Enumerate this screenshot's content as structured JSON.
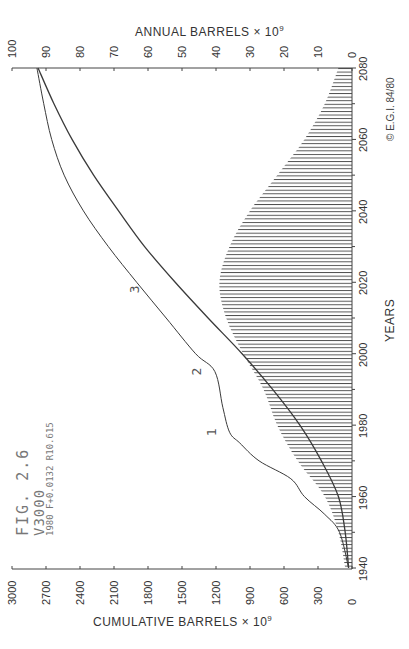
{
  "chart_data": {
    "type": "area",
    "orientation": "rotated-90-ccw",
    "title": "FIG. 2.6",
    "subtitle": "V3000",
    "annotation": "1980 F+0.0132 R10.615",
    "copyright": "© E.G.I. 84/80",
    "xlabel": "YEARS",
    "x_ticks": [
      1940,
      1960,
      1980,
      2000,
      2020,
      2040,
      2060,
      2080
    ],
    "xlim": [
      1940,
      2080
    ],
    "y_axes": [
      {
        "name": "cumulative",
        "label": "CUMULATIVE BARRELS × 10^9",
        "label_main": "CUMULATIVE  BARRELS",
        "label_suffix": "× 10",
        "label_exp": "9",
        "ticks": [
          0,
          300,
          600,
          900,
          1200,
          1500,
          1800,
          2100,
          2400,
          2700,
          3000
        ],
        "ylim": [
          0,
          3000
        ]
      },
      {
        "name": "annual",
        "label": "ANNUAL BARRELS × 10^9",
        "label_main": "ANNUAL  BARRELS",
        "label_suffix": "× 10",
        "label_exp": "9",
        "ticks": [
          0,
          10,
          20,
          30,
          40,
          50,
          60,
          70,
          80,
          90,
          100
        ],
        "ylim": [
          0,
          100
        ]
      }
    ],
    "series": [
      {
        "name": "Annual production (hatched)",
        "axis": "annual",
        "style": "hatched-area",
        "x": [
          1940,
          1950,
          1960,
          1970,
          1980,
          1990,
          2000,
          2010,
          2020,
          2030,
          2040,
          2050,
          2060,
          2070,
          2080
        ],
        "values": [
          2,
          4,
          8,
          16,
          22,
          26,
          32,
          37,
          39,
          36,
          30,
          22,
          14,
          8,
          4
        ]
      },
      {
        "name": "Cumulative production (logistic)",
        "axis": "cumulative",
        "style": "line",
        "x": [
          1940,
          1950,
          1960,
          1970,
          1980,
          1990,
          2000,
          2010,
          2020,
          2030,
          2040,
          2050,
          2060,
          2070,
          2080
        ],
        "values": [
          30,
          60,
          120,
          270,
          460,
          700,
          970,
          1270,
          1560,
          1830,
          2060,
          2280,
          2470,
          2630,
          2770
        ]
      },
      {
        "name": "Cumulative discoveries",
        "axis": "cumulative",
        "style": "line",
        "point_labels": [
          {
            "label": "1",
            "x": 1978,
            "value": 1080
          },
          {
            "label": "2",
            "x": 1995,
            "value": 1210
          },
          {
            "label": "3",
            "x": 2018,
            "value": 1760
          }
        ],
        "x": [
          1940,
          1950,
          1955,
          1960,
          1965,
          1970,
          1975,
          1978,
          1985,
          1995,
          2000,
          2010,
          2020,
          2030,
          2040,
          2050,
          2060,
          2070,
          2080
        ],
        "values": [
          30,
          110,
          240,
          420,
          540,
          820,
          990,
          1080,
          1140,
          1210,
          1380,
          1640,
          1900,
          2150,
          2370,
          2540,
          2650,
          2720,
          2780
        ]
      }
    ],
    "grid": false,
    "legend": "none (curves labeled 1, 2, 3)"
  }
}
